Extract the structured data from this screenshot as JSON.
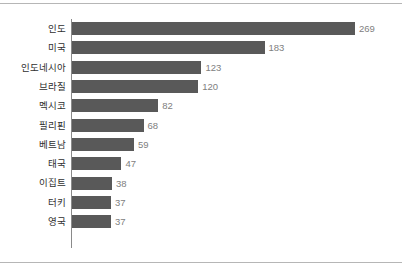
{
  "chart_data": {
    "type": "bar",
    "orientation": "horizontal",
    "title": "",
    "subtitle": "",
    "xlabel": "",
    "ylabel": "",
    "categories": [
      "인도",
      "미국",
      "인도네시아",
      "브라질",
      "멕시코",
      "필리핀",
      "베트남",
      "태국",
      "이집트",
      "터키",
      "영국"
    ],
    "values": [
      269,
      183,
      123,
      120,
      82,
      68,
      59,
      47,
      38,
      37,
      37
    ],
    "value_labels": [
      "269",
      "183",
      "123",
      "120",
      "82",
      "68",
      "59",
      "47",
      "38",
      "37",
      "37"
    ],
    "xlim": [
      0,
      269
    ],
    "grid": false,
    "legend": null,
    "tick_labels": [],
    "annotations": [],
    "colors": {
      "bar": "#595959",
      "value_label": "#808080",
      "category_label": "#2f2f2f",
      "axis_line": "#8a8a8a",
      "rule": "#b6b6b6",
      "background": "#ffffff"
    }
  }
}
